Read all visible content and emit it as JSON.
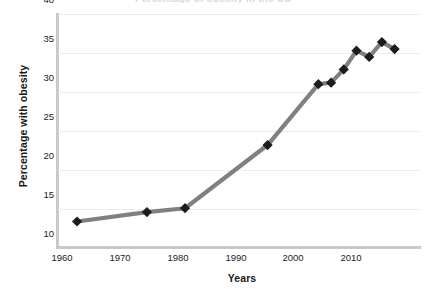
{
  "chart_data": {
    "type": "line",
    "title": "Percentage of obesity in the US",
    "xlabel": "Years",
    "ylabel": "Percentage with obesity",
    "xlim": [
      1958,
      2015
    ],
    "ylim": [
      10,
      40
    ],
    "yticks": [
      10,
      15,
      20,
      25,
      30,
      35,
      40
    ],
    "xticks": [
      1960,
      1970,
      1980,
      1990,
      2000,
      2010
    ],
    "grid": true,
    "legend": false,
    "series": [
      {
        "name": "Percentage with obesity",
        "line_color": "#808080",
        "marker_color": "#1c1c1c",
        "marker": "diamond",
        "x": [
          1961,
          1972,
          1978,
          1991,
          1999,
          2001,
          2003,
          2005,
          2007,
          2009,
          2011
        ],
        "values": [
          13.4,
          14.6,
          15.1,
          23.2,
          31.0,
          31.2,
          32.9,
          35.3,
          34.5,
          36.4,
          35.5
        ]
      }
    ]
  },
  "axis": {
    "y_tick_labels": [
      "40",
      "35",
      "30",
      "25",
      "20",
      "15",
      "10"
    ],
    "x_tick_labels": [
      "1960",
      "1970",
      "1980",
      "1990",
      "2000",
      "2010"
    ]
  },
  "colors": {
    "line": "#808080",
    "marker": "#1c1c1c",
    "grid": "#ededed",
    "axis": "#c9c9c9",
    "text": "#1a1a1a"
  }
}
